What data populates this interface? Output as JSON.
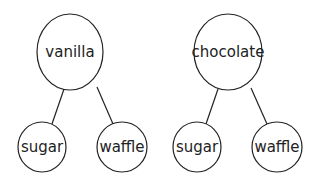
{
  "trees": [
    {
      "root": {
        "label": "vanilla"
      },
      "children": [
        {
          "label": "sugar"
        },
        {
          "label": "waffle"
        }
      ]
    },
    {
      "root": {
        "label": "chocolate"
      },
      "children": [
        {
          "label": "sugar"
        },
        {
          "label": "waffle"
        }
      ]
    }
  ],
  "colors": {
    "stroke": "#222222",
    "background": "#ffffff"
  }
}
